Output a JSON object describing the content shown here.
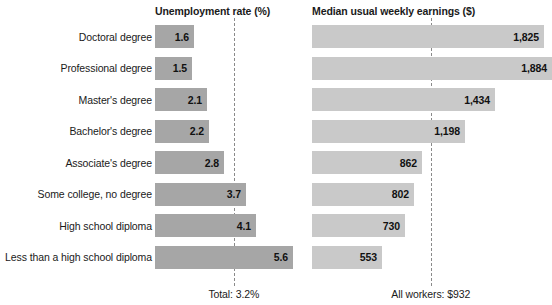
{
  "chart_data": {
    "type": "bar",
    "title": "",
    "orientation": "horizontal",
    "panels": [
      {
        "key": "unemployment",
        "title": "Unemployment rate (%)",
        "xlabel": "",
        "ylabel": "",
        "reference_line": {
          "value": 3.2,
          "label": "Total: 3.2%"
        },
        "xlim": [
          0,
          6.0
        ],
        "grid": false,
        "legend": "none",
        "bar_color": "#a6a6a6",
        "values": [
          1.6,
          1.5,
          2.1,
          2.2,
          2.8,
          3.7,
          4.1,
          5.6
        ],
        "value_labels": [
          "1.6",
          "1.5",
          "2.1",
          "2.2",
          "2.8",
          "3.7",
          "4.1",
          "5.6"
        ]
      },
      {
        "key": "earnings",
        "title": "Median usual weekly earnings ($)",
        "xlabel": "",
        "ylabel": "",
        "reference_line": {
          "value": 932,
          "label": "All workers: $932"
        },
        "xlim": [
          0,
          1884
        ],
        "grid": false,
        "legend": "none",
        "bar_color": "#c9c9c9",
        "values": [
          1825,
          1884,
          1434,
          1198,
          862,
          802,
          730,
          553
        ],
        "value_labels": [
          "1,825",
          "1,884",
          "1,434",
          "1,198",
          "862",
          "802",
          "730",
          "553"
        ]
      }
    ],
    "categories": [
      "Doctoral degree",
      "Professional degree",
      "Master's degree",
      "Bachelor's degree",
      "Associate's degree",
      "Some college, no degree",
      "High school diploma",
      "Less than a high school diploma"
    ]
  },
  "headers": {
    "left": "Unemployment rate (%)",
    "right": "Median usual weekly earnings ($)"
  },
  "footnotes": {
    "left": "Total: 3.2%",
    "right": "All workers: $932"
  },
  "colors": {
    "bar_left": "#a6a6a6",
    "bar_right": "#c9c9c9",
    "dash": "#8a8a8a",
    "text": "#1a1a1a",
    "background": "#ffffff"
  }
}
